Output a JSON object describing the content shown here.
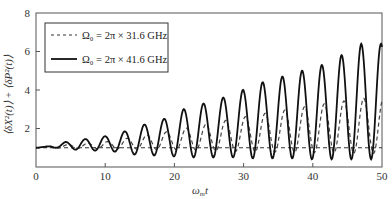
{
  "chart_data": {
    "type": "line",
    "title": "",
    "xlabel": "ω_m t",
    "ylabel": "⟨δX²(t)⟩ + ⟨δP²(t)⟩",
    "xlim": [
      0,
      50
    ],
    "ylim": [
      0,
      8
    ],
    "xticks": [
      0,
      10,
      20,
      30,
      40,
      50
    ],
    "yticks": [
      2,
      4,
      6,
      8
    ],
    "grid": false,
    "legend_position": "upper-left",
    "legend": [
      "Ω₀ = 2π × 31.6 GHz",
      "Ω₀ = 2π × 41.6 GHz"
    ],
    "series": [
      {
        "name": "Ω₀ = 2π × 31.6 GHz",
        "style": "dashed",
        "period": 2.85,
        "baseline": 1.0,
        "peak_envelope": [
          [
            0,
            1.05
          ],
          [
            10,
            1.3
          ],
          [
            20,
            1.9
          ],
          [
            30,
            2.6
          ],
          [
            40,
            3.2
          ],
          [
            48,
            3.6
          ]
        ],
        "trough_envelope": [
          [
            0,
            1.0
          ],
          [
            10,
            0.95
          ],
          [
            20,
            0.9
          ],
          [
            30,
            0.8
          ],
          [
            40,
            0.75
          ],
          [
            50,
            0.7
          ]
        ]
      },
      {
        "name": "Ω₀ = 2π × 41.6 GHz",
        "style": "solid",
        "period": 2.85,
        "baseline": 1.0,
        "peaks": [
          [
            1.4,
            1.05
          ],
          [
            4.3,
            1.3
          ],
          [
            7.1,
            1.45
          ],
          [
            10.0,
            1.6
          ],
          [
            12.8,
            1.85
          ],
          [
            15.6,
            2.2
          ],
          [
            18.5,
            2.5
          ],
          [
            21.3,
            3.0
          ],
          [
            24.2,
            3.3
          ],
          [
            27.0,
            3.6
          ],
          [
            29.9,
            4.0
          ],
          [
            32.7,
            4.4
          ],
          [
            35.6,
            4.7
          ],
          [
            38.4,
            5.0
          ],
          [
            41.3,
            5.3
          ],
          [
            44.1,
            5.8
          ],
          [
            47.0,
            6.4
          ]
        ],
        "troughs": [
          [
            3.0,
            1.0
          ],
          [
            5.7,
            0.9
          ],
          [
            8.6,
            0.85
          ],
          [
            11.4,
            0.8
          ],
          [
            14.2,
            0.65
          ],
          [
            17.1,
            0.6
          ],
          [
            19.9,
            0.55
          ],
          [
            22.8,
            0.5
          ],
          [
            25.6,
            0.5
          ],
          [
            28.5,
            0.5
          ],
          [
            31.3,
            0.45
          ],
          [
            34.2,
            0.45
          ],
          [
            37.0,
            0.45
          ],
          [
            39.9,
            0.4
          ],
          [
            42.7,
            0.4
          ],
          [
            45.6,
            0.4
          ],
          [
            48.4,
            0.4
          ]
        ]
      },
      {
        "name": "reference",
        "style": "dashed-horizontal",
        "y": 1.0
      }
    ]
  },
  "labels": {
    "x_axis": "ω",
    "x_axis_sub": "m",
    "x_axis_var": "t",
    "y_axis": "⟨δX²(t)⟩ + ⟨δP²(t)⟩",
    "legend_1": "Ω₀ = 2π × 31.6 GHz",
    "legend_2": "Ω₀ = 2π × 41.6 GHz",
    "xtick_0": "0",
    "xtick_10": "10",
    "xtick_20": "20",
    "xtick_30": "30",
    "xtick_40": "40",
    "xtick_50": "50",
    "ytick_2": "2",
    "ytick_4": "4",
    "ytick_6": "6",
    "ytick_8": "8"
  }
}
